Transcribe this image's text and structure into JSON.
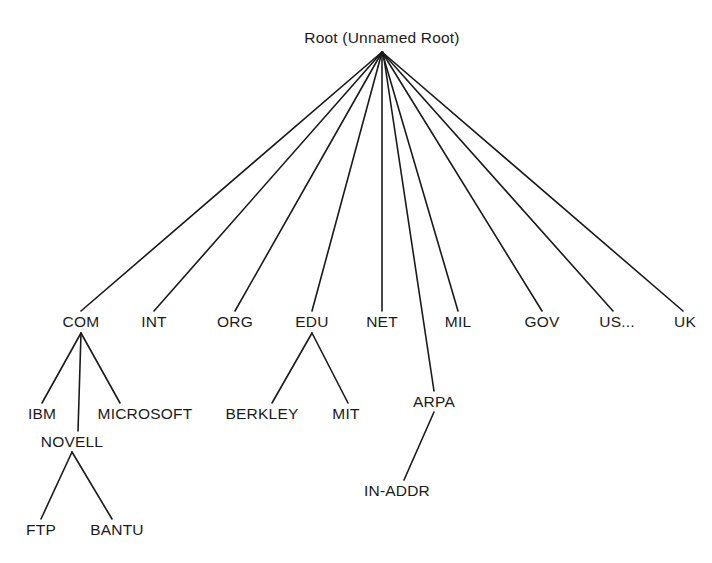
{
  "diagram": {
    "type": "tree",
    "canvas": {
      "width": 712,
      "height": 563
    },
    "style": {
      "background": "#ffffff",
      "line_color": "#1a1a1a",
      "text_color": "#1a1a1a",
      "line_width": 1.6
    },
    "nodes": [
      {
        "id": "root",
        "label": "Root (Unnamed Root)",
        "x": 382,
        "y": 38,
        "level": 0,
        "anchor_x": 382,
        "anchor_y": 52
      },
      {
        "id": "com",
        "label": "COM",
        "x": 81,
        "y": 322,
        "level": 1,
        "anchor_x": 81,
        "anchor_y": 333
      },
      {
        "id": "int",
        "label": "INT",
        "x": 154,
        "y": 322,
        "level": 1,
        "anchor_x": 154,
        "anchor_y": 333
      },
      {
        "id": "org",
        "label": "ORG",
        "x": 235,
        "y": 322,
        "level": 1,
        "anchor_x": 235,
        "anchor_y": 333
      },
      {
        "id": "edu",
        "label": "EDU",
        "x": 312,
        "y": 322,
        "level": 1,
        "anchor_x": 312,
        "anchor_y": 333
      },
      {
        "id": "net",
        "label": "NET",
        "x": 382,
        "y": 322,
        "level": 1,
        "anchor_x": 382,
        "anchor_y": 333
      },
      {
        "id": "mil",
        "label": "MIL",
        "x": 458,
        "y": 322,
        "level": 1,
        "anchor_x": 458,
        "anchor_y": 333
      },
      {
        "id": "gov",
        "label": "GOV",
        "x": 542,
        "y": 322,
        "level": 1,
        "anchor_x": 542,
        "anchor_y": 333
      },
      {
        "id": "us",
        "label": "US...",
        "x": 617,
        "y": 322,
        "level": 1,
        "anchor_x": 613,
        "anchor_y": 333
      },
      {
        "id": "uk",
        "label": "UK",
        "x": 685,
        "y": 322,
        "level": 1,
        "anchor_x": 683,
        "anchor_y": 333
      },
      {
        "id": "ibm",
        "label": "IBM",
        "x": 42,
        "y": 414,
        "level": 2,
        "anchor_x": 42,
        "anchor_y": 403
      },
      {
        "id": "novell",
        "label": "NOVELL",
        "x": 72,
        "y": 442,
        "level": 2,
        "anchor_x": 72,
        "anchor_y": 431
      },
      {
        "id": "microsoft",
        "label": "MICROSOFT",
        "x": 145,
        "y": 414,
        "level": 2,
        "anchor_x": 120,
        "anchor_y": 403
      },
      {
        "id": "berkley",
        "label": "BERKLEY",
        "x": 262,
        "y": 414,
        "level": 2,
        "anchor_x": 272,
        "anchor_y": 403
      },
      {
        "id": "mit",
        "label": "MIT",
        "x": 346,
        "y": 414,
        "level": 2,
        "anchor_x": 346,
        "anchor_y": 403
      },
      {
        "id": "arpa",
        "label": "ARPA",
        "x": 434,
        "y": 402,
        "level": 2,
        "anchor_x": 434,
        "anchor_y": 391
      },
      {
        "id": "in-addr",
        "label": "IN-ADDR",
        "x": 397,
        "y": 491,
        "level": 3,
        "anchor_x": 404,
        "anchor_y": 480
      },
      {
        "id": "ftp",
        "label": "FTP",
        "x": 41,
        "y": 530,
        "level": 3,
        "anchor_x": 41,
        "anchor_y": 519
      },
      {
        "id": "bantu",
        "label": "BANTU",
        "x": 117,
        "y": 530,
        "level": 3,
        "anchor_x": 112,
        "anchor_y": 519
      }
    ],
    "edges": [
      {
        "from": "root",
        "to": "com",
        "x1": 382,
        "y1": 52,
        "x2": 81,
        "y2": 311
      },
      {
        "from": "root",
        "to": "int",
        "x1": 382,
        "y1": 52,
        "x2": 154,
        "y2": 311
      },
      {
        "from": "root",
        "to": "org",
        "x1": 382,
        "y1": 52,
        "x2": 235,
        "y2": 311
      },
      {
        "from": "root",
        "to": "edu",
        "x1": 382,
        "y1": 52,
        "x2": 312,
        "y2": 311
      },
      {
        "from": "root",
        "to": "net",
        "x1": 382,
        "y1": 52,
        "x2": 382,
        "y2": 311
      },
      {
        "from": "root",
        "to": "arpa",
        "x1": 383,
        "y1": 52,
        "x2": 434,
        "y2": 391
      },
      {
        "from": "root",
        "to": "mil",
        "x1": 382,
        "y1": 52,
        "x2": 458,
        "y2": 311
      },
      {
        "from": "root",
        "to": "gov",
        "x1": 382,
        "y1": 52,
        "x2": 542,
        "y2": 311
      },
      {
        "from": "root",
        "to": "us",
        "x1": 382,
        "y1": 52,
        "x2": 613,
        "y2": 311
      },
      {
        "from": "root",
        "to": "uk",
        "x1": 382,
        "y1": 52,
        "x2": 683,
        "y2": 311
      },
      {
        "from": "com",
        "to": "ibm",
        "x1": 81,
        "y1": 333,
        "x2": 42,
        "y2": 403
      },
      {
        "from": "com",
        "to": "novell",
        "x1": 81,
        "y1": 333,
        "x2": 78,
        "y2": 431
      },
      {
        "from": "com",
        "to": "microsoft",
        "x1": 81,
        "y1": 333,
        "x2": 120,
        "y2": 403
      },
      {
        "from": "edu",
        "to": "berkley",
        "x1": 312,
        "y1": 333,
        "x2": 272,
        "y2": 403
      },
      {
        "from": "edu",
        "to": "mit",
        "x1": 312,
        "y1": 333,
        "x2": 348,
        "y2": 403
      },
      {
        "from": "arpa",
        "to": "in-addr",
        "x1": 434,
        "y1": 412,
        "x2": 404,
        "y2": 480
      },
      {
        "from": "novell",
        "to": "ftp",
        "x1": 72,
        "y1": 452,
        "x2": 41,
        "y2": 519
      },
      {
        "from": "novell",
        "to": "bantu",
        "x1": 72,
        "y1": 452,
        "x2": 112,
        "y2": 519
      }
    ]
  }
}
